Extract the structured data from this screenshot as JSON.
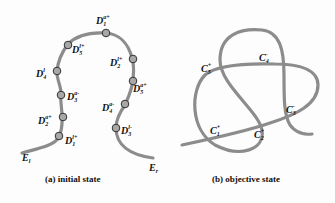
{
  "figure_a": {
    "caption": "(a) initial state",
    "labels": [
      {
        "id": "D1a+",
        "base": "D",
        "sub": "1",
        "sup": "a+",
        "x": 96,
        "y": 14
      },
      {
        "id": "D5l+",
        "base": "D",
        "sub": "5",
        "sup": "l+",
        "x": 72,
        "y": 43
      },
      {
        "id": "D2l+",
        "base": "D",
        "sub": "2",
        "sup": "l+",
        "x": 110,
        "y": 56
      },
      {
        "id": "D4l",
        "base": "D",
        "sub": "4",
        "sup": "l",
        "x": 36,
        "y": 67
      },
      {
        "id": "D5a+",
        "base": "D",
        "sub": "5",
        "sup": "a+",
        "x": 133,
        "y": 82
      },
      {
        "id": "D3a-",
        "base": "D",
        "sub": "3",
        "sup": "a-",
        "x": 67,
        "y": 90
      },
      {
        "id": "D4a-",
        "base": "D",
        "sub": "4",
        "sup": "a-",
        "x": 102,
        "y": 101
      },
      {
        "id": "D2a+",
        "base": "D",
        "sub": "2",
        "sup": "a+",
        "x": 38,
        "y": 114
      },
      {
        "id": "D3l-",
        "base": "D",
        "sub": "3",
        "sup": "l-",
        "x": 121,
        "y": 124
      },
      {
        "id": "D1l+",
        "base": "D",
        "sub": "1",
        "sup": "l+",
        "x": 65,
        "y": 134
      },
      {
        "id": "El",
        "base": "E",
        "sub": "l",
        "sup": "",
        "x": 22,
        "y": 151
      },
      {
        "id": "Er",
        "base": "E",
        "sub": "r",
        "sup": "",
        "x": 149,
        "y": 161
      }
    ]
  },
  "figure_b": {
    "caption": "(b) objective state",
    "labels": [
      {
        "id": "C4-",
        "base": "C",
        "sub": "4",
        "sup": "-",
        "x": 259,
        "y": 51
      },
      {
        "id": "C5+",
        "base": "C",
        "sub": "5",
        "sup": "+",
        "x": 201,
        "y": 62
      },
      {
        "id": "C3-",
        "base": "C",
        "sub": "3",
        "sup": "-",
        "x": 286,
        "y": 103
      },
      {
        "id": "C1+",
        "base": "C",
        "sub": "1",
        "sup": "+",
        "x": 210,
        "y": 124
      },
      {
        "id": "C2+",
        "base": "C",
        "sub": "2",
        "sup": "+",
        "x": 254,
        "y": 128
      }
    ]
  },
  "colors": {
    "rope": "#8c8c8c",
    "node_stroke": "#333333",
    "node_fill": "#a8a8a8"
  }
}
